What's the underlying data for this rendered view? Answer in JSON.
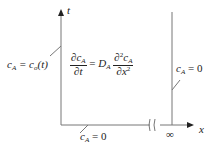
{
  "axes": {
    "x_label": "x",
    "y_label": "t",
    "infinity": "∞"
  },
  "equation": {
    "lhs_num": "∂c",
    "lhs_den": "∂t",
    "coef": "D",
    "rhs_num_pre": "∂",
    "rhs_num_post": "c",
    "rhs_den": "∂x",
    "sub": "A",
    "sq": "2",
    "eq": "="
  },
  "boundary_left": {
    "lhs": "c",
    "sub": "A",
    "rhs": "= c",
    "rhs_sub": "o",
    "rhs_tail": "(t)"
  },
  "boundary_right": {
    "lhs": "c",
    "sub": "A",
    "rhs": "= 0"
  },
  "boundary_bottom": {
    "lhs": "c",
    "sub": "A",
    "rhs": "= 0"
  }
}
